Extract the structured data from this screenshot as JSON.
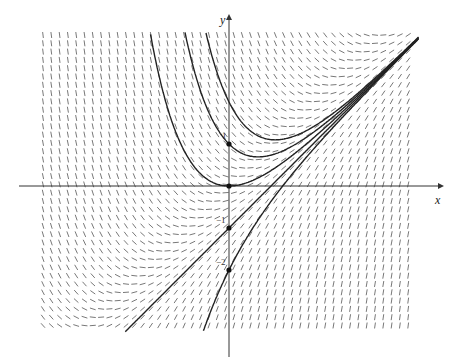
{
  "diagram": {
    "equation": "dy/dx = x - y",
    "axes": {
      "x_label": "x",
      "y_label": "y",
      "origin_px": [
        229,
        186
      ],
      "unit_px": 42,
      "x_axis_px": [
        19,
        440
      ],
      "y_axis_px": [
        357,
        18
      ]
    },
    "field": {
      "x_range_px": [
        43,
        415
      ],
      "y_range_px": [
        35,
        330
      ],
      "spacing_px": 8.3,
      "segment_len_px": 6,
      "color": "#555555"
    },
    "tick_labels": [
      {
        "text": "1",
        "y": 1
      },
      {
        "text": "−1",
        "y": -1
      },
      {
        "text": "−2",
        "y": -2
      }
    ],
    "points": [
      {
        "x": 0,
        "y": 1
      },
      {
        "x": 0,
        "y": 0
      },
      {
        "x": 0,
        "y": -1
      },
      {
        "x": 0,
        "y": -2
      }
    ],
    "solution_curves": [
      {
        "C": 3
      },
      {
        "C": 2
      },
      {
        "C": 1
      },
      {
        "C": 0
      },
      {
        "C": -1
      }
    ],
    "curve_color": "#222222"
  }
}
